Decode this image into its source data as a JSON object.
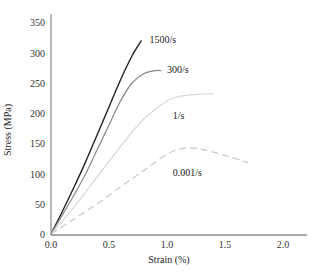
{
  "chart_data": {
    "type": "line",
    "title": "",
    "xlabel": "Strain (%)",
    "ylabel": "Stress (MPa)",
    "xlim": [
      0,
      2.2
    ],
    "ylim": [
      0,
      370
    ],
    "xticks": [
      "0.0",
      "0.5",
      "1.0",
      "1.5",
      "2.0"
    ],
    "yticks": [
      "0",
      "50",
      "100",
      "150",
      "200",
      "250",
      "300",
      "350"
    ],
    "grid": false,
    "legend": "inline labels",
    "series": [
      {
        "name": "1500/s",
        "color": "#222222",
        "dash": "solid",
        "x": [
          0,
          0.1,
          0.2,
          0.3,
          0.4,
          0.5,
          0.6,
          0.7,
          0.78
        ],
        "y": [
          0,
          38,
          78,
          120,
          165,
          210,
          255,
          295,
          320
        ]
      },
      {
        "name": "300/s",
        "color": "#888888",
        "dash": "solid",
        "x": [
          0,
          0.1,
          0.2,
          0.3,
          0.4,
          0.5,
          0.6,
          0.7,
          0.8,
          0.9,
          0.95
        ],
        "y": [
          0,
          32,
          65,
          100,
          140,
          180,
          220,
          250,
          265,
          270,
          270
        ]
      },
      {
        "name": "1/s",
        "color": "#d8d8d8",
        "dash": "solid",
        "x": [
          0,
          0.2,
          0.4,
          0.6,
          0.8,
          1.0,
          1.1,
          1.2,
          1.3,
          1.4
        ],
        "y": [
          0,
          45,
          95,
          145,
          190,
          220,
          227,
          230,
          231,
          232
        ]
      },
      {
        "name": "0.001/s",
        "color": "#c8c8c8",
        "dash": "dashed",
        "x": [
          0,
          0.2,
          0.4,
          0.6,
          0.8,
          1.0,
          1.15,
          1.3,
          1.5,
          1.7
        ],
        "y": [
          0,
          25,
          50,
          78,
          105,
          132,
          142,
          140,
          130,
          118
        ]
      }
    ],
    "annotations": [
      {
        "text": "1500/s",
        "x": 0.85,
        "y": 322
      },
      {
        "text": "300/s",
        "x": 1.0,
        "y": 272
      },
      {
        "text": "1/s",
        "x": 1.05,
        "y": 196
      },
      {
        "text": "0.001/s",
        "x": 1.05,
        "y": 103
      }
    ]
  }
}
